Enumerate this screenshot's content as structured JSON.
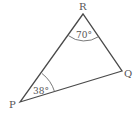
{
  "diagram": {
    "type": "triangle",
    "stroke_color": "#4a4a4a",
    "text_color": "#555555",
    "vertices": [
      {
        "name": "P",
        "x": 20,
        "y": 102,
        "label_x": 9,
        "label_y": 108
      },
      {
        "name": "Q",
        "x": 122,
        "y": 71,
        "label_x": 124,
        "label_y": 77
      },
      {
        "name": "R",
        "x": 83,
        "y": 14,
        "label_x": 79,
        "label_y": 10
      }
    ],
    "angles": [
      {
        "vertex": "R",
        "value": "70°",
        "text_x": 76,
        "text_y": 38
      },
      {
        "vertex": "P",
        "value": "38°",
        "text_x": 33,
        "text_y": 94
      }
    ]
  }
}
